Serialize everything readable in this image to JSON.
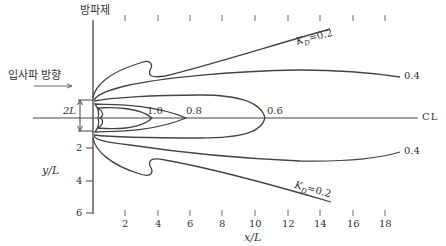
{
  "diagram": {
    "breakwater_label": "방파제",
    "incident_label": "입사파 방향",
    "bracket_label": "2L",
    "centerline_label": "CL",
    "y_axis_label": "y/L",
    "x_axis_label": "x/L",
    "contours": [
      {
        "value": "1.0",
        "label": "1.0"
      },
      {
        "value": "0.8",
        "label": "0.8"
      },
      {
        "value": "0.6",
        "label": "0.6"
      },
      {
        "value": "0.4",
        "label_top": "0.4",
        "label_bottom": "0.4"
      },
      {
        "value": "0.2",
        "label_top": "K_D=0.2",
        "label_bottom": "K_D=0.2"
      }
    ],
    "kd_top": {
      "k": "K",
      "sub": "D",
      "rest": "=0.2"
    },
    "kd_bottom": {
      "k": "K",
      "sub": "D",
      "rest": "=0.2"
    },
    "label_10": "1.0",
    "label_08": "0.8",
    "label_06": "0.6",
    "label_04_top": "0.4",
    "label_04_bottom": "0.4",
    "x_ticks": [
      "2",
      "4",
      "6",
      "8",
      "10",
      "12",
      "14",
      "16",
      "18"
    ],
    "y_ticks": [
      "2",
      "4",
      "6"
    ]
  },
  "colors": {
    "line": "#444444",
    "text": "#333333"
  }
}
